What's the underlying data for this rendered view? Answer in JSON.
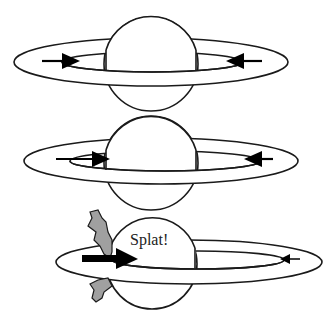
{
  "diagram": {
    "panels": [
      {
        "id": "panel-1",
        "description": "Planet with ring, particles on inner orbit moving toward each other"
      },
      {
        "id": "panel-2",
        "description": "Planet with ring, particles approaching"
      },
      {
        "id": "panel-3",
        "description": "Particle collides with planet",
        "label": "Splat!"
      }
    ],
    "colors": {
      "outline": "#1a1a1a",
      "planet_fill": "#ffffff",
      "splat_fill": "#a0a0a0",
      "arrow": "#000000"
    }
  }
}
